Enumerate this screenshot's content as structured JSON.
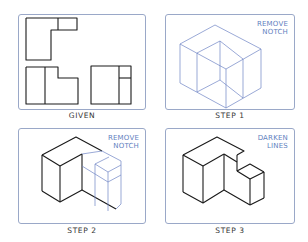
{
  "panels": [
    {
      "id": "given",
      "caption": "GIVEN",
      "note": ""
    },
    {
      "id": "step1",
      "caption": "STEP 1",
      "note_lines": [
        "REMOVE",
        "NOTCH"
      ]
    },
    {
      "id": "step2",
      "caption": "STEP 2",
      "note_lines": [
        "REMOVE",
        "NOTCH"
      ]
    },
    {
      "id": "step3",
      "caption": "STEP 3",
      "note_lines": [
        "DARKEN",
        "LINES"
      ]
    }
  ],
  "colors": {
    "note_blue": "#5f7fc0",
    "construction_line": "#6f84c4",
    "object_line": "#1a1a1a",
    "panel_border": "#9aa8c8"
  }
}
